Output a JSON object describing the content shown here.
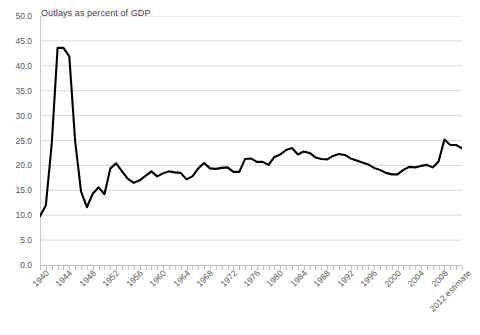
{
  "chart_data": {
    "type": "line",
    "title": "Outlays as percent of GDP",
    "xlabel": "",
    "ylabel": "",
    "ylim": [
      0.0,
      50.0
    ],
    "ytick_step": 5.0,
    "ytick_labels": [
      "0.0",
      "5.0",
      "10.0",
      "15.0",
      "20.0",
      "25.0",
      "30.0",
      "35.0",
      "40.0",
      "45.0",
      "50.0"
    ],
    "grid": true,
    "grid_axis": "y",
    "legend": "none",
    "line_color": "#000000",
    "grid_color": "#d9d9d9",
    "axis_color": "#bfbfbf",
    "label_color": "#595959",
    "xlim": [
      1940,
      2012
    ],
    "xtick_labels": [
      "1940",
      "1944",
      "1948",
      "1952",
      "1956",
      "1960",
      "1964",
      "1968",
      "1972",
      "1976",
      "1980",
      "1984",
      "1988",
      "1992",
      "1996",
      "2000",
      "2004",
      "2008",
      "2012 estimate"
    ],
    "xtick_label_rotation": -45,
    "xtick_label_years": [
      1940,
      1944,
      1948,
      1952,
      1956,
      1960,
      1964,
      1968,
      1972,
      1976,
      1980,
      1984,
      1988,
      1992,
      1996,
      2000,
      2004,
      2008,
      2012
    ],
    "x": [
      1940,
      1941,
      1942,
      1943,
      1944,
      1945,
      1946,
      1947,
      1948,
      1949,
      1950,
      1951,
      1952,
      1953,
      1954,
      1955,
      1956,
      1957,
      1958,
      1959,
      1960,
      1961,
      1962,
      1963,
      1964,
      1965,
      1966,
      1967,
      1968,
      1969,
      1970,
      1971,
      1972,
      1973,
      1974,
      1975,
      1976,
      1977,
      1978,
      1979,
      1980,
      1981,
      1982,
      1983,
      1984,
      1985,
      1986,
      1987,
      1988,
      1989,
      1990,
      1991,
      1992,
      1993,
      1994,
      1995,
      1996,
      1997,
      1998,
      1999,
      2000,
      2001,
      2002,
      2003,
      2004,
      2005,
      2006,
      2007,
      2008,
      2009,
      2010,
      2011,
      2012
    ],
    "values": [
      9.8,
      12.0,
      24.3,
      43.6,
      43.6,
      41.9,
      24.8,
      14.8,
      11.6,
      14.3,
      15.6,
      14.2,
      19.4,
      20.4,
      18.8,
      17.3,
      16.5,
      17.0,
      17.9,
      18.8,
      17.8,
      18.4,
      18.8,
      18.6,
      18.5,
      17.2,
      17.8,
      19.4,
      20.5,
      19.4,
      19.3,
      19.5,
      19.6,
      18.7,
      18.7,
      21.3,
      21.4,
      20.7,
      20.7,
      20.1,
      21.7,
      22.2,
      23.1,
      23.5,
      22.2,
      22.8,
      22.5,
      21.6,
      21.3,
      21.2,
      21.9,
      22.3,
      22.1,
      21.4,
      21.0,
      20.6,
      20.2,
      19.5,
      19.1,
      18.5,
      18.2,
      18.2,
      19.1,
      19.7,
      19.6,
      19.9,
      20.1,
      19.6,
      20.8,
      25.2,
      24.1,
      24.1,
      23.4
    ],
    "annotations": {
      "wwii_peak_year": 1943,
      "wwii_peak_value": 43.6,
      "postwar_trough_year": 1948,
      "postwar_trough_value": 11.6,
      "recession_peak_year": 2009,
      "recession_peak_value": 25.2,
      "final_year_label": "2012 estimate",
      "final_value": 23.4
    }
  }
}
